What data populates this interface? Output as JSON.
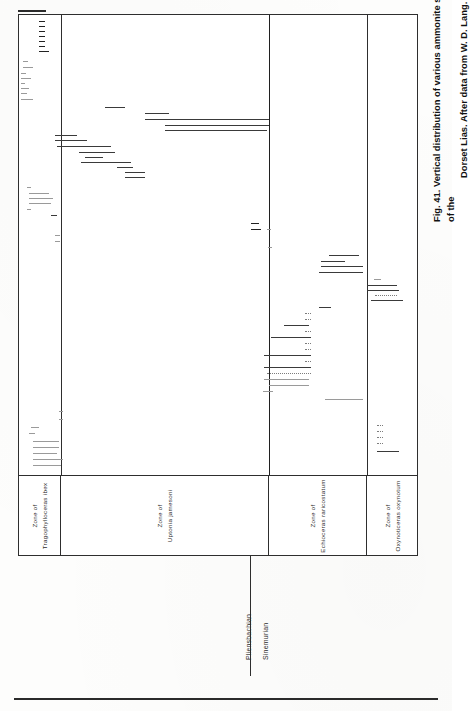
{
  "figure": {
    "number": "Fig. 41.",
    "caption_line1": "Fig. 41.   Vertical  distribution  of  various  ammonite  species  in  a  part  of  the",
    "caption_line2": "Dorset Lias. After data from W. D. Lang.",
    "caption_full": "Fig. 41. Vertical distribution of various ammonite species in a part of the Dorset Lias. After data from W. D. Lang.",
    "source": "After data from W. D. Lang.",
    "locality": "Dorset Lias"
  },
  "axes": {
    "value_axis_label": "",
    "category_axis_label": "",
    "orientation": "rotated-90-ccw"
  },
  "stages": [
    {
      "name": "Pliensbachian",
      "start": 0,
      "end": 250
    },
    {
      "name": "Sinemurian",
      "start": 250,
      "end": 400
    }
  ],
  "zones": [
    {
      "label_line1": "Zone  of",
      "label_line2": "Tragophylloceras  ibex",
      "start": 0,
      "end": 42,
      "genus": "Tragophylloceras",
      "species": "ibex"
    },
    {
      "label_line1": "Zone  of",
      "label_line2": "Uptonia  jamesoni",
      "start": 42,
      "end": 250,
      "genus": "Uptonia",
      "species": "jamesoni"
    },
    {
      "label_line1": "Zone  of",
      "label_line2": "Echioceras  raricostatum",
      "start": 250,
      "end": 348,
      "genus": "Echioceras",
      "species": "raricostatum"
    },
    {
      "label_line1": "Zone  of",
      "label_line2": "Oxynoticeras  oxynotum",
      "start": 348,
      "end": 400,
      "genus": "Oxynoticeras",
      "species": "oxynotum"
    }
  ],
  "chart_data": {
    "type": "range-chart",
    "title": "Vertical distribution of various ammonite species in a part of the Dorset Lias",
    "xlabel": "Stratigraphic position (zones)",
    "ylabel": "Ammonite species (one line each)",
    "xlim": [
      0,
      400
    ],
    "ylim": [
      0,
      462
    ],
    "grid": false,
    "legend": "none",
    "note": "Each horizontal line is the observed stratigraphic range of one ammonite species; x runs left-to-right across four ammonite zones, y separates the species.",
    "ranges": [
      {
        "i": 1,
        "x0": 20,
        "x1": 26,
        "y": 6,
        "style": "thick"
      },
      {
        "i": 2,
        "x0": 20,
        "x1": 26,
        "y": 11,
        "style": "thick"
      },
      {
        "i": 3,
        "x0": 20,
        "x1": 26,
        "y": 16,
        "style": "thick"
      },
      {
        "i": 4,
        "x0": 20,
        "x1": 26,
        "y": 21,
        "style": "thick"
      },
      {
        "i": 5,
        "x0": 20,
        "x1": 26,
        "y": 26,
        "style": "thick"
      },
      {
        "i": 6,
        "x0": 20,
        "x1": 26,
        "y": 31,
        "style": "thick"
      },
      {
        "i": 7,
        "x0": 20,
        "x1": 30,
        "y": 36,
        "style": "thick"
      },
      {
        "i": 8,
        "x0": 4,
        "x1": 9,
        "y": 46,
        "style": "faint"
      },
      {
        "i": 9,
        "x0": 4,
        "x1": 14,
        "y": 52,
        "style": "faint"
      },
      {
        "i": 10,
        "x0": 2,
        "x1": 7,
        "y": 58,
        "style": "faint"
      },
      {
        "i": 11,
        "x0": 2,
        "x1": 12,
        "y": 63,
        "style": "faint"
      },
      {
        "i": 12,
        "x0": 2,
        "x1": 6,
        "y": 68,
        "style": "faint"
      },
      {
        "i": 13,
        "x0": 2,
        "x1": 10,
        "y": 73,
        "style": "faint"
      },
      {
        "i": 14,
        "x0": 2,
        "x1": 8,
        "y": 78,
        "style": "faint"
      },
      {
        "i": 15,
        "x0": 2,
        "x1": 14,
        "y": 84,
        "style": "faint"
      },
      {
        "i": 16,
        "x0": 86,
        "x1": 106,
        "y": 92,
        "style": "solid"
      },
      {
        "i": 17,
        "x0": 126,
        "x1": 150,
        "y": 98,
        "style": "solid"
      },
      {
        "i": 18,
        "x0": 126,
        "x1": 250,
        "y": 104,
        "style": "solid"
      },
      {
        "i": 19,
        "x0": 146,
        "x1": 250,
        "y": 110,
        "style": "solid"
      },
      {
        "i": 20,
        "x0": 146,
        "x1": 248,
        "y": 115,
        "style": "solid"
      },
      {
        "i": 21,
        "x0": 36,
        "x1": 58,
        "y": 120,
        "style": "solid"
      },
      {
        "i": 22,
        "x0": 36,
        "x1": 68,
        "y": 125,
        "style": "solid"
      },
      {
        "i": 23,
        "x0": 38,
        "x1": 92,
        "y": 131,
        "style": "solid"
      },
      {
        "i": 24,
        "x0": 60,
        "x1": 96,
        "y": 137,
        "style": "solid"
      },
      {
        "i": 25,
        "x0": 66,
        "x1": 84,
        "y": 142,
        "style": "solid"
      },
      {
        "i": 26,
        "x0": 62,
        "x1": 112,
        "y": 147,
        "style": "solid"
      },
      {
        "i": 27,
        "x0": 98,
        "x1": 114,
        "y": 152,
        "style": "solid"
      },
      {
        "i": 28,
        "x0": 106,
        "x1": 126,
        "y": 157,
        "style": "solid"
      },
      {
        "i": 29,
        "x0": 106,
        "x1": 126,
        "y": 162,
        "style": "solid"
      },
      {
        "i": 30,
        "x0": 8,
        "x1": 12,
        "y": 172,
        "style": "faint"
      },
      {
        "i": 31,
        "x0": 10,
        "x1": 30,
        "y": 178,
        "style": "faint"
      },
      {
        "i": 32,
        "x0": 10,
        "x1": 34,
        "y": 183,
        "style": "faint"
      },
      {
        "i": 33,
        "x0": 10,
        "x1": 32,
        "y": 188,
        "style": "faint"
      },
      {
        "i": 34,
        "x0": 8,
        "x1": 12,
        "y": 194,
        "style": "faint"
      },
      {
        "i": 35,
        "x0": 32,
        "x1": 38,
        "y": 200,
        "style": "solid"
      },
      {
        "i": 36,
        "x0": 232,
        "x1": 240,
        "y": 208,
        "style": "thick"
      },
      {
        "i": 37,
        "x0": 232,
        "x1": 242,
        "y": 214,
        "style": "thick"
      },
      {
        "i": 38,
        "x0": 248,
        "x1": 252,
        "y": 214,
        "style": "faint"
      },
      {
        "i": 39,
        "x0": 36,
        "x1": 41,
        "y": 220,
        "style": "faint"
      },
      {
        "i": 40,
        "x0": 36,
        "x1": 41,
        "y": 226,
        "style": "faint"
      },
      {
        "i": 41,
        "x0": 249,
        "x1": 253,
        "y": 232,
        "style": "faint"
      },
      {
        "i": 42,
        "x0": 310,
        "x1": 340,
        "y": 240,
        "style": "solid"
      },
      {
        "i": 43,
        "x0": 302,
        "x1": 326,
        "y": 246,
        "style": "solid"
      },
      {
        "i": 44,
        "x0": 302,
        "x1": 344,
        "y": 251,
        "style": "solid"
      },
      {
        "i": 45,
        "x0": 300,
        "x1": 344,
        "y": 257,
        "style": "solid"
      },
      {
        "i": 46,
        "x0": 355,
        "x1": 362,
        "y": 264,
        "style": "faint"
      },
      {
        "i": 47,
        "x0": 348,
        "x1": 378,
        "y": 270,
        "style": "solid"
      },
      {
        "i": 48,
        "x0": 348,
        "x1": 380,
        "y": 275,
        "style": "solid"
      },
      {
        "i": 49,
        "x0": 356,
        "x1": 378,
        "y": 280,
        "style": "dotted"
      },
      {
        "i": 50,
        "x0": 352,
        "x1": 384,
        "y": 285,
        "style": "solid"
      },
      {
        "i": 51,
        "x0": 300,
        "x1": 312,
        "y": 292,
        "style": "solid"
      },
      {
        "i": 52,
        "x0": 286,
        "x1": 292,
        "y": 298,
        "style": "dotted"
      },
      {
        "i": 53,
        "x0": 286,
        "x1": 292,
        "y": 304,
        "style": "dotted"
      },
      {
        "i": 54,
        "x0": 265,
        "x1": 290,
        "y": 310,
        "style": "solid"
      },
      {
        "i": 55,
        "x0": 286,
        "x1": 292,
        "y": 316,
        "style": "dotted"
      },
      {
        "i": 56,
        "x0": 252,
        "x1": 292,
        "y": 322,
        "style": "solid"
      },
      {
        "i": 57,
        "x0": 286,
        "x1": 292,
        "y": 328,
        "style": "dotted"
      },
      {
        "i": 58,
        "x0": 286,
        "x1": 292,
        "y": 334,
        "style": "dotted"
      },
      {
        "i": 59,
        "x0": 245,
        "x1": 292,
        "y": 340,
        "style": "solid"
      },
      {
        "i": 60,
        "x0": 286,
        "x1": 292,
        "y": 346,
        "style": "dotted"
      },
      {
        "i": 61,
        "x0": 245,
        "x1": 292,
        "y": 352,
        "style": "solid"
      },
      {
        "i": 62,
        "x0": 248,
        "x1": 292,
        "y": 358,
        "style": "dotted"
      },
      {
        "i": 63,
        "x0": 245,
        "x1": 290,
        "y": 364,
        "style": "faint"
      },
      {
        "i": 64,
        "x0": 250,
        "x1": 290,
        "y": 370,
        "style": "faint"
      },
      {
        "i": 65,
        "x0": 244,
        "x1": 254,
        "y": 376,
        "style": "faint"
      },
      {
        "i": 66,
        "x0": 306,
        "x1": 344,
        "y": 384,
        "style": "faint"
      },
      {
        "i": 67,
        "x0": 358,
        "x1": 364,
        "y": 410,
        "style": "dotted"
      },
      {
        "i": 68,
        "x0": 358,
        "x1": 364,
        "y": 416,
        "style": "dotted"
      },
      {
        "i": 69,
        "x0": 358,
        "x1": 364,
        "y": 422,
        "style": "dotted"
      },
      {
        "i": 70,
        "x0": 358,
        "x1": 364,
        "y": 428,
        "style": "dotted"
      },
      {
        "i": 71,
        "x0": 358,
        "x1": 380,
        "y": 436,
        "style": "solid"
      },
      {
        "i": 72,
        "x0": 40,
        "x1": 44,
        "y": 396,
        "style": "faint"
      },
      {
        "i": 73,
        "x0": 40,
        "x1": 44,
        "y": 404,
        "style": "faint"
      },
      {
        "i": 74,
        "x0": 12,
        "x1": 20,
        "y": 412,
        "style": "faint"
      },
      {
        "i": 75,
        "x0": 10,
        "x1": 16,
        "y": 418,
        "style": "faint"
      },
      {
        "i": 76,
        "x0": 14,
        "x1": 40,
        "y": 426,
        "style": "faint"
      },
      {
        "i": 77,
        "x0": 14,
        "x1": 40,
        "y": 432,
        "style": "faint"
      },
      {
        "i": 78,
        "x0": 14,
        "x1": 38,
        "y": 438,
        "style": "faint"
      },
      {
        "i": 79,
        "x0": 14,
        "x1": 44,
        "y": 444,
        "style": "faint"
      },
      {
        "i": 80,
        "x0": 14,
        "x1": 42,
        "y": 450,
        "style": "faint"
      }
    ]
  }
}
